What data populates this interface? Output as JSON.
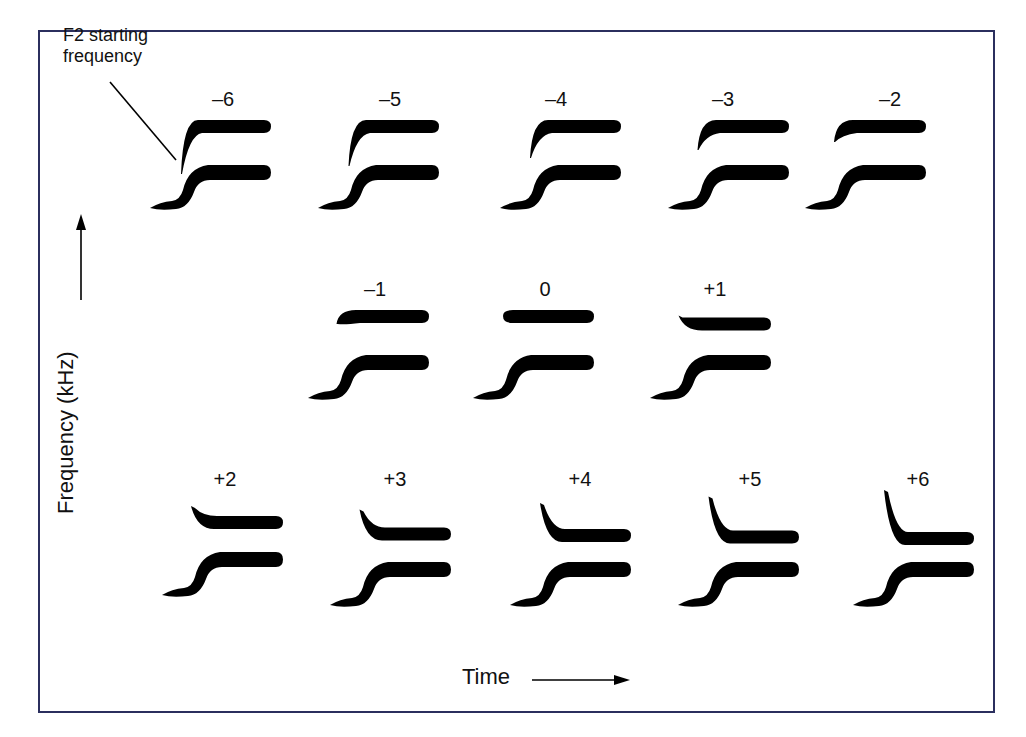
{
  "callout": {
    "line1": "F2 starting",
    "line2": "frequency"
  },
  "axes": {
    "ylabel": "Frequency (kHz)",
    "xlabel": "Time"
  },
  "colors": {
    "frame": "#2b2f5e",
    "ink": "#000000"
  },
  "chart_data": {
    "type": "diagram",
    "title": "",
    "xlabel": "Time",
    "ylabel": "Frequency (kHz)",
    "stimuli": [
      {
        "label": "–6",
        "offset": -6,
        "x": 150,
        "y": 118,
        "lx": 223,
        "ly": 88
      },
      {
        "label": "–5",
        "offset": -5,
        "x": 318,
        "y": 118,
        "lx": 390,
        "ly": 88
      },
      {
        "label": "–4",
        "offset": -4,
        "x": 500,
        "y": 118,
        "lx": 556,
        "ly": 88
      },
      {
        "label": "–3",
        "offset": -3,
        "x": 668,
        "y": 118,
        "lx": 723,
        "ly": 88
      },
      {
        "label": "–2",
        "offset": -2,
        "x": 805,
        "y": 118,
        "lx": 890,
        "ly": 88
      },
      {
        "label": "–1",
        "offset": -1,
        "x": 308,
        "y": 308,
        "lx": 375,
        "ly": 278
      },
      {
        "label": "0",
        "offset": 0,
        "x": 473,
        "y": 308,
        "lx": 545,
        "ly": 278
      },
      {
        "label": "+1",
        "offset": 1,
        "x": 650,
        "y": 308,
        "lx": 715,
        "ly": 278
      },
      {
        "label": "+2",
        "offset": 2,
        "x": 162,
        "y": 505,
        "lx": 225,
        "ly": 468
      },
      {
        "label": "+3",
        "offset": 3,
        "x": 330,
        "y": 515,
        "lx": 395,
        "ly": 468
      },
      {
        "label": "+4",
        "offset": 4,
        "x": 510,
        "y": 515,
        "lx": 580,
        "ly": 468
      },
      {
        "label": "+5",
        "offset": 5,
        "x": 678,
        "y": 515,
        "lx": 750,
        "ly": 468
      },
      {
        "label": "+6",
        "offset": 6,
        "x": 853,
        "y": 515,
        "lx": 918,
        "ly": 468
      }
    ]
  }
}
